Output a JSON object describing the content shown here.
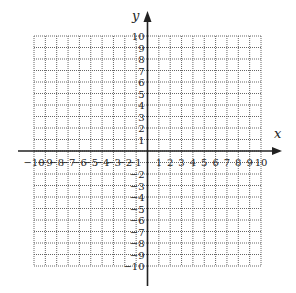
{
  "chart_data": {
    "type": "coordinate-grid",
    "title": "",
    "xlabel": "x",
    "ylabel": "y",
    "xlim": [
      -10,
      10
    ],
    "ylim": [
      -10,
      10
    ],
    "grid": true,
    "grid_style": "dotted",
    "x_ticks": [
      -10,
      -9,
      -8,
      -7,
      -6,
      -5,
      -4,
      -3,
      -2,
      -1,
      1,
      2,
      3,
      4,
      5,
      6,
      7,
      8,
      9,
      10
    ],
    "y_ticks": [
      -10,
      -9,
      -8,
      -7,
      -6,
      -5,
      -4,
      -3,
      -2,
      -1,
      1,
      2,
      3,
      4,
      5,
      6,
      7,
      8,
      9,
      10
    ],
    "series": []
  },
  "colors": {
    "axis": "#222222",
    "grid": "#666666",
    "background": "#ffffff"
  },
  "layout": {
    "grid_left": 34,
    "grid_right": 261,
    "grid_top": 36,
    "grid_bottom": 266,
    "origin_x": 147.5,
    "origin_y": 151
  }
}
